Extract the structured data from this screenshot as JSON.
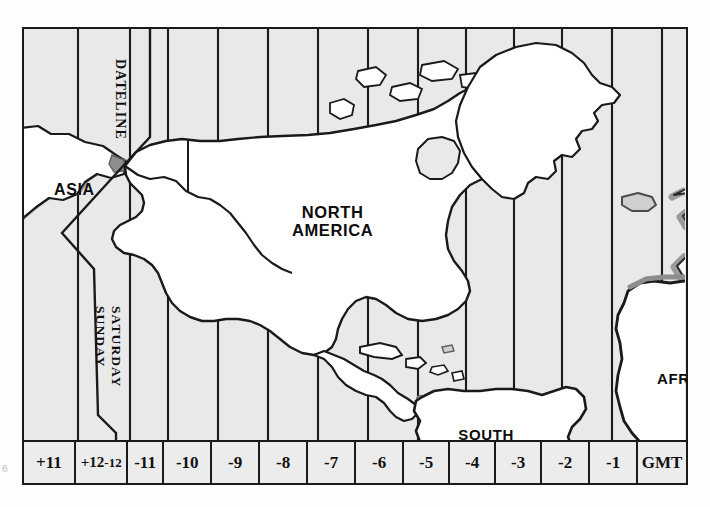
{
  "figure": {
    "kind": "world-time-zone-map",
    "region": "Pacific / Americas / Atlantic",
    "margin_artifact": "6"
  },
  "map": {
    "ocean_color": "#e9e9e9",
    "land_color": "#ffffff",
    "outline_color": "#1a1a1a",
    "shaded_coast_color": "#9a9a9a",
    "frame_color": "#1a1a1a"
  },
  "continents": [
    {
      "key": "asia",
      "label": "ASIA"
    },
    {
      "key": "north_america",
      "label": "NORTH\nAMERICA"
    },
    {
      "key": "south_america",
      "label": "SOUTH\nAMERICA"
    },
    {
      "key": "africa",
      "label": "AFRICA"
    }
  ],
  "dateline": {
    "label": "DATELINE",
    "day_ahead": "SATURDAY",
    "day_behind": "SUNDAY"
  },
  "zones": [
    {
      "label": "+11",
      "dual": false
    },
    {
      "label": "+12",
      "dual": true,
      "label_b": "-12"
    },
    {
      "label": "-11",
      "dual": false
    },
    {
      "label": "-10",
      "dual": false
    },
    {
      "label": "-9",
      "dual": false
    },
    {
      "label": "-8",
      "dual": false
    },
    {
      "label": "-7",
      "dual": false
    },
    {
      "label": "-6",
      "dual": false
    },
    {
      "label": "-5",
      "dual": false
    },
    {
      "label": "-4",
      "dual": false
    },
    {
      "label": "-3",
      "dual": false
    },
    {
      "label": "-2",
      "dual": false
    },
    {
      "label": "-1",
      "dual": false
    },
    {
      "label": "GMT",
      "dual": false
    }
  ],
  "zone_widths": [
    54,
    52,
    38,
    50,
    50,
    50,
    50,
    50,
    48,
    48,
    48,
    50,
    50,
    50
  ]
}
